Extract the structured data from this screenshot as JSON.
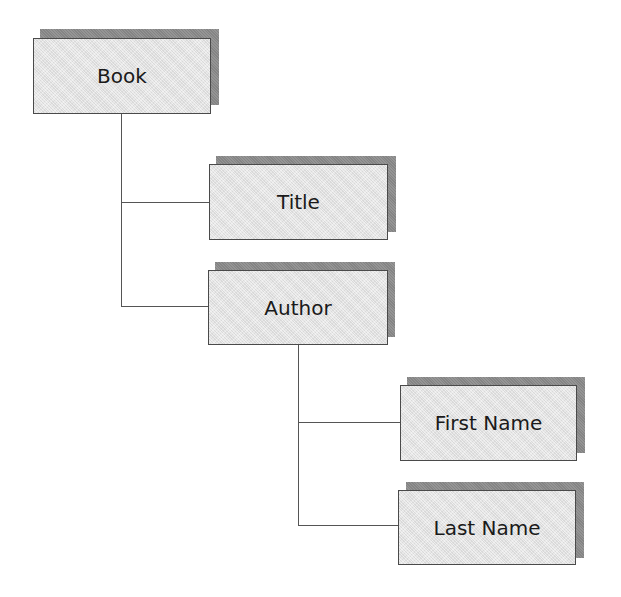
{
  "diagram": {
    "type": "hierarchy-tree",
    "nodes": [
      {
        "id": "book",
        "label": "Book",
        "parent": null
      },
      {
        "id": "title",
        "label": "Title",
        "parent": "book"
      },
      {
        "id": "author",
        "label": "Author",
        "parent": "book"
      },
      {
        "id": "first-name",
        "label": "First Name",
        "parent": "author"
      },
      {
        "id": "last-name",
        "label": "Last Name",
        "parent": "author"
      }
    ],
    "colors": {
      "box_fill": "#e4e4e4",
      "box_border": "#4a4a4a",
      "shadow": "#8c8c8c",
      "connector": "#555555",
      "text": "#1a1a1a"
    }
  }
}
